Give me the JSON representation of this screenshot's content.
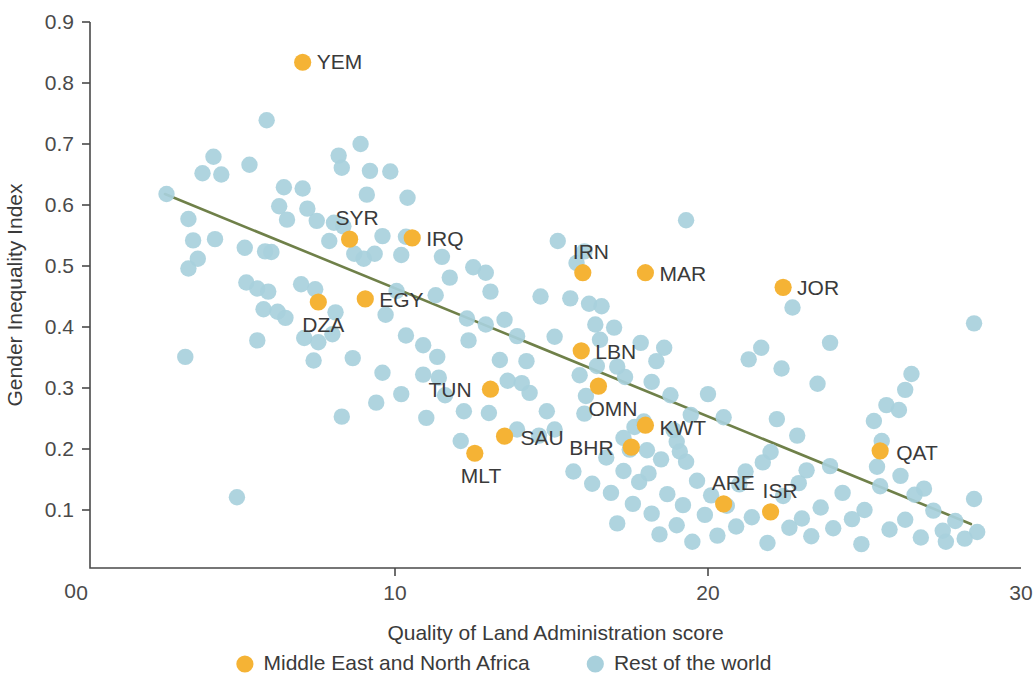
{
  "chart_data": {
    "type": "scatter",
    "title": "",
    "xlabel": "Quality of Land Administration score",
    "ylabel": "Gender Inequality Index",
    "xlim": [
      0,
      30
    ],
    "ylim": [
      0,
      0.9
    ],
    "xticks": [
      "0",
      "10",
      "20",
      "30"
    ],
    "xtick_values": [
      0,
      10,
      20,
      30
    ],
    "yticks": [
      "0",
      "0.1",
      "0.2",
      "0.3",
      "0.4",
      "0.5",
      "0.6",
      "0.7",
      "0.8",
      "0.9"
    ],
    "ytick_values": [
      0,
      0.1,
      0.2,
      0.3,
      0.4,
      0.5,
      0.6,
      0.7,
      0.8,
      0.9
    ],
    "grid": false,
    "legend_position": "bottom",
    "colors": {
      "mena": "#F5B335",
      "rest": "#A8D0DC",
      "trendline": "#6F8049",
      "axis": "#4a4a4a",
      "text": "#3a3a3a",
      "background": "#ffffff"
    },
    "legend": [
      {
        "label": "Middle East and North Africa",
        "color": "#F5B335",
        "key": "mena"
      },
      {
        "label": "Rest of the world",
        "color": "#A8D0DC",
        "key": "rest"
      }
    ],
    "trendline": {
      "x": [
        2.65,
        28.4
      ],
      "y": [
        0.618,
        0.077
      ]
    },
    "series": [
      {
        "name": "Middle East and North Africa",
        "key": "mena",
        "color": "#F5B335",
        "points": [
          {
            "label": "YEM",
            "x": 7.05,
            "y": 0.834,
            "lx": 14,
            "ly": 7
          },
          {
            "label": "SYR",
            "x": 8.55,
            "y": 0.544,
            "lx": -14,
            "ly": -14
          },
          {
            "label": "IRQ",
            "x": 10.55,
            "y": 0.546,
            "lx": 14,
            "ly": 8
          },
          {
            "label": "DZA",
            "x": 7.55,
            "y": 0.441,
            "lx": -16,
            "ly": 30
          },
          {
            "label": "EGY",
            "x": 9.05,
            "y": 0.446,
            "lx": 14,
            "ly": 8
          },
          {
            "label": "IRN",
            "x": 16.0,
            "y": 0.489,
            "lx": -10,
            "ly": -14
          },
          {
            "label": "MAR",
            "x": 18.0,
            "y": 0.489,
            "lx": 14,
            "ly": 8
          },
          {
            "label": "JOR",
            "x": 22.4,
            "y": 0.465,
            "lx": 14,
            "ly": 8
          },
          {
            "label": "LBN",
            "x": 15.95,
            "y": 0.361,
            "lx": 14,
            "ly": 8
          },
          {
            "label": "OMN",
            "x": 16.5,
            "y": 0.303,
            "lx": -10,
            "ly": 30
          },
          {
            "label": "TUN",
            "x": 13.05,
            "y": 0.298,
            "lx": -62,
            "ly": 8
          },
          {
            "label": "KWT",
            "x": 18.0,
            "y": 0.239,
            "lx": 14,
            "ly": 10
          },
          {
            "label": "SAU",
            "x": 13.5,
            "y": 0.221,
            "lx": 16,
            "ly": 9
          },
          {
            "label": "BHR",
            "x": 17.55,
            "y": 0.203,
            "lx": -62,
            "ly": 8
          },
          {
            "label": "MLT",
            "x": 12.55,
            "y": 0.193,
            "lx": -14,
            "ly": 30
          },
          {
            "label": "QAT",
            "x": 25.5,
            "y": 0.197,
            "lx": 16,
            "ly": 9
          },
          {
            "label": "ARE",
            "x": 20.5,
            "y": 0.11,
            "lx": -12,
            "ly": -14
          },
          {
            "label": "ISR",
            "x": 22.0,
            "y": 0.097,
            "lx": -8,
            "ly": -14
          }
        ]
      },
      {
        "name": "Rest of the world",
        "key": "rest",
        "color": "#A8D0DC",
        "points": [
          {
            "x": 5.9,
            "y": 0.739
          },
          {
            "x": 4.2,
            "y": 0.679
          },
          {
            "x": 5.35,
            "y": 0.666
          },
          {
            "x": 3.85,
            "y": 0.652
          },
          {
            "x": 4.45,
            "y": 0.65
          },
          {
            "x": 8.9,
            "y": 0.7
          },
          {
            "x": 8.2,
            "y": 0.681
          },
          {
            "x": 8.3,
            "y": 0.661
          },
          {
            "x": 9.2,
            "y": 0.656
          },
          {
            "x": 9.85,
            "y": 0.655
          },
          {
            "x": 2.7,
            "y": 0.618
          },
          {
            "x": 6.45,
            "y": 0.629
          },
          {
            "x": 7.05,
            "y": 0.627
          },
          {
            "x": 9.1,
            "y": 0.617
          },
          {
            "x": 10.4,
            "y": 0.612
          },
          {
            "x": 3.4,
            "y": 0.577
          },
          {
            "x": 6.3,
            "y": 0.598
          },
          {
            "x": 7.2,
            "y": 0.594
          },
          {
            "x": 6.55,
            "y": 0.576
          },
          {
            "x": 7.5,
            "y": 0.574
          },
          {
            "x": 8.05,
            "y": 0.571
          },
          {
            "x": 8.35,
            "y": 0.565
          },
          {
            "x": 3.55,
            "y": 0.542
          },
          {
            "x": 4.25,
            "y": 0.544
          },
          {
            "x": 7.9,
            "y": 0.541
          },
          {
            "x": 9.6,
            "y": 0.549
          },
          {
            "x": 10.35,
            "y": 0.548
          },
          {
            "x": 5.2,
            "y": 0.53
          },
          {
            "x": 3.7,
            "y": 0.512
          },
          {
            "x": 3.4,
            "y": 0.496
          },
          {
            "x": 5.85,
            "y": 0.524
          },
          {
            "x": 6.05,
            "y": 0.523
          },
          {
            "x": 8.7,
            "y": 0.52
          },
          {
            "x": 9.35,
            "y": 0.52
          },
          {
            "x": 9.0,
            "y": 0.512
          },
          {
            "x": 10.2,
            "y": 0.518
          },
          {
            "x": 11.5,
            "y": 0.515
          },
          {
            "x": 15.2,
            "y": 0.541
          },
          {
            "x": 19.3,
            "y": 0.575
          },
          {
            "x": 16.05,
            "y": 0.524
          },
          {
            "x": 15.8,
            "y": 0.505
          },
          {
            "x": 12.5,
            "y": 0.498
          },
          {
            "x": 12.9,
            "y": 0.489
          },
          {
            "x": 11.75,
            "y": 0.481
          },
          {
            "x": 5.25,
            "y": 0.473
          },
          {
            "x": 5.6,
            "y": 0.463
          },
          {
            "x": 5.95,
            "y": 0.458
          },
          {
            "x": 7.0,
            "y": 0.47
          },
          {
            "x": 7.45,
            "y": 0.462
          },
          {
            "x": 10.05,
            "y": 0.459
          },
          {
            "x": 11.3,
            "y": 0.452
          },
          {
            "x": 13.05,
            "y": 0.458
          },
          {
            "x": 14.65,
            "y": 0.45
          },
          {
            "x": 15.6,
            "y": 0.447
          },
          {
            "x": 16.2,
            "y": 0.438
          },
          {
            "x": 16.6,
            "y": 0.434
          },
          {
            "x": 22.7,
            "y": 0.432
          },
          {
            "x": 28.5,
            "y": 0.406
          },
          {
            "x": 5.8,
            "y": 0.429
          },
          {
            "x": 6.25,
            "y": 0.425
          },
          {
            "x": 6.5,
            "y": 0.415
          },
          {
            "x": 8.1,
            "y": 0.424
          },
          {
            "x": 9.7,
            "y": 0.42
          },
          {
            "x": 12.3,
            "y": 0.414
          },
          {
            "x": 13.5,
            "y": 0.412
          },
          {
            "x": 12.9,
            "y": 0.404
          },
          {
            "x": 16.4,
            "y": 0.404
          },
          {
            "x": 17.0,
            "y": 0.399
          },
          {
            "x": 5.6,
            "y": 0.378
          },
          {
            "x": 7.1,
            "y": 0.382
          },
          {
            "x": 7.55,
            "y": 0.375
          },
          {
            "x": 8.0,
            "y": 0.388
          },
          {
            "x": 10.35,
            "y": 0.386
          },
          {
            "x": 10.9,
            "y": 0.37
          },
          {
            "x": 12.35,
            "y": 0.378
          },
          {
            "x": 13.9,
            "y": 0.385
          },
          {
            "x": 15.1,
            "y": 0.384
          },
          {
            "x": 16.55,
            "y": 0.379
          },
          {
            "x": 17.85,
            "y": 0.374
          },
          {
            "x": 18.6,
            "y": 0.366
          },
          {
            "x": 21.7,
            "y": 0.366
          },
          {
            "x": 23.9,
            "y": 0.374
          },
          {
            "x": 3.3,
            "y": 0.351
          },
          {
            "x": 7.4,
            "y": 0.345
          },
          {
            "x": 8.65,
            "y": 0.349
          },
          {
            "x": 11.35,
            "y": 0.351
          },
          {
            "x": 13.35,
            "y": 0.346
          },
          {
            "x": 14.2,
            "y": 0.344
          },
          {
            "x": 16.45,
            "y": 0.336
          },
          {
            "x": 17.1,
            "y": 0.335
          },
          {
            "x": 18.35,
            "y": 0.344
          },
          {
            "x": 21.3,
            "y": 0.347
          },
          {
            "x": 22.35,
            "y": 0.332
          },
          {
            "x": 26.5,
            "y": 0.323
          },
          {
            "x": 9.6,
            "y": 0.325
          },
          {
            "x": 10.9,
            "y": 0.322
          },
          {
            "x": 11.4,
            "y": 0.317
          },
          {
            "x": 13.6,
            "y": 0.312
          },
          {
            "x": 14.05,
            "y": 0.308
          },
          {
            "x": 15.9,
            "y": 0.321
          },
          {
            "x": 17.35,
            "y": 0.318
          },
          {
            "x": 18.2,
            "y": 0.31
          },
          {
            "x": 23.5,
            "y": 0.307
          },
          {
            "x": 26.3,
            "y": 0.297
          },
          {
            "x": 10.2,
            "y": 0.29
          },
          {
            "x": 11.6,
            "y": 0.288
          },
          {
            "x": 14.3,
            "y": 0.292
          },
          {
            "x": 16.1,
            "y": 0.287
          },
          {
            "x": 18.8,
            "y": 0.288
          },
          {
            "x": 20.0,
            "y": 0.29
          },
          {
            "x": 25.7,
            "y": 0.272
          },
          {
            "x": 26.1,
            "y": 0.264
          },
          {
            "x": 8.3,
            "y": 0.253
          },
          {
            "x": 12.2,
            "y": 0.262
          },
          {
            "x": 13.0,
            "y": 0.259
          },
          {
            "x": 14.85,
            "y": 0.262
          },
          {
            "x": 16.05,
            "y": 0.258
          },
          {
            "x": 17.95,
            "y": 0.245
          },
          {
            "x": 19.45,
            "y": 0.256
          },
          {
            "x": 20.5,
            "y": 0.252
          },
          {
            "x": 22.2,
            "y": 0.249
          },
          {
            "x": 25.3,
            "y": 0.246
          },
          {
            "x": 15.1,
            "y": 0.232
          },
          {
            "x": 17.65,
            "y": 0.236
          },
          {
            "x": 18.9,
            "y": 0.231
          },
          {
            "x": 17.3,
            "y": 0.218
          },
          {
            "x": 19.0,
            "y": 0.212
          },
          {
            "x": 22.85,
            "y": 0.222
          },
          {
            "x": 25.55,
            "y": 0.213
          },
          {
            "x": 17.5,
            "y": 0.199
          },
          {
            "x": 18.05,
            "y": 0.198
          },
          {
            "x": 19.1,
            "y": 0.196
          },
          {
            "x": 22.0,
            "y": 0.195
          },
          {
            "x": 16.75,
            "y": 0.186
          },
          {
            "x": 18.5,
            "y": 0.183
          },
          {
            "x": 19.3,
            "y": 0.179
          },
          {
            "x": 21.75,
            "y": 0.178
          },
          {
            "x": 23.9,
            "y": 0.172
          },
          {
            "x": 25.4,
            "y": 0.171
          },
          {
            "x": 15.7,
            "y": 0.163
          },
          {
            "x": 17.3,
            "y": 0.164
          },
          {
            "x": 18.1,
            "y": 0.16
          },
          {
            "x": 21.2,
            "y": 0.163
          },
          {
            "x": 23.15,
            "y": 0.165
          },
          {
            "x": 26.15,
            "y": 0.156
          },
          {
            "x": 16.3,
            "y": 0.143
          },
          {
            "x": 17.8,
            "y": 0.146
          },
          {
            "x": 19.65,
            "y": 0.148
          },
          {
            "x": 21.0,
            "y": 0.142
          },
          {
            "x": 22.9,
            "y": 0.144
          },
          {
            "x": 25.5,
            "y": 0.139
          },
          {
            "x": 26.9,
            "y": 0.135
          },
          {
            "x": 4.95,
            "y": 0.121
          },
          {
            "x": 16.9,
            "y": 0.128
          },
          {
            "x": 18.7,
            "y": 0.126
          },
          {
            "x": 20.1,
            "y": 0.124
          },
          {
            "x": 22.4,
            "y": 0.123
          },
          {
            "x": 24.3,
            "y": 0.128
          },
          {
            "x": 26.6,
            "y": 0.125
          },
          {
            "x": 28.5,
            "y": 0.118
          },
          {
            "x": 17.6,
            "y": 0.11
          },
          {
            "x": 19.2,
            "y": 0.108
          },
          {
            "x": 20.6,
            "y": 0.107
          },
          {
            "x": 23.6,
            "y": 0.104
          },
          {
            "x": 25.0,
            "y": 0.1
          },
          {
            "x": 27.2,
            "y": 0.099
          },
          {
            "x": 18.2,
            "y": 0.094
          },
          {
            "x": 19.9,
            "y": 0.092
          },
          {
            "x": 21.4,
            "y": 0.088
          },
          {
            "x": 23.0,
            "y": 0.086
          },
          {
            "x": 24.6,
            "y": 0.085
          },
          {
            "x": 26.3,
            "y": 0.084
          },
          {
            "x": 27.9,
            "y": 0.082
          },
          {
            "x": 17.1,
            "y": 0.078
          },
          {
            "x": 19.0,
            "y": 0.075
          },
          {
            "x": 20.9,
            "y": 0.073
          },
          {
            "x": 22.6,
            "y": 0.071
          },
          {
            "x": 24.0,
            "y": 0.07
          },
          {
            "x": 25.8,
            "y": 0.068
          },
          {
            "x": 27.5,
            "y": 0.066
          },
          {
            "x": 28.6,
            "y": 0.064
          },
          {
            "x": 18.45,
            "y": 0.06
          },
          {
            "x": 20.3,
            "y": 0.058
          },
          {
            "x": 23.3,
            "y": 0.057
          },
          {
            "x": 26.8,
            "y": 0.055
          },
          {
            "x": 28.2,
            "y": 0.053
          },
          {
            "x": 19.5,
            "y": 0.048
          },
          {
            "x": 21.9,
            "y": 0.046
          },
          {
            "x": 24.9,
            "y": 0.044
          },
          {
            "x": 27.6,
            "y": 0.048
          },
          {
            "x": 12.1,
            "y": 0.213
          },
          {
            "x": 11.0,
            "y": 0.251
          },
          {
            "x": 9.4,
            "y": 0.276
          },
          {
            "x": 14.6,
            "y": 0.222
          },
          {
            "x": 13.9,
            "y": 0.232
          }
        ]
      }
    ]
  }
}
